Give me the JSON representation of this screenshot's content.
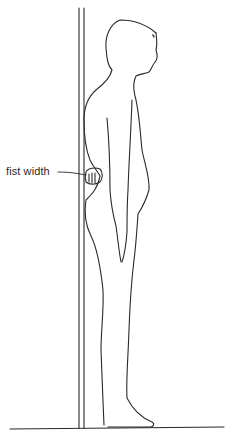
{
  "figure": {
    "annotation": {
      "label": "fist width",
      "target": "gap between lower back and wall"
    }
  },
  "colors": {
    "line": "#2a2a2a",
    "background": "#ffffff"
  }
}
